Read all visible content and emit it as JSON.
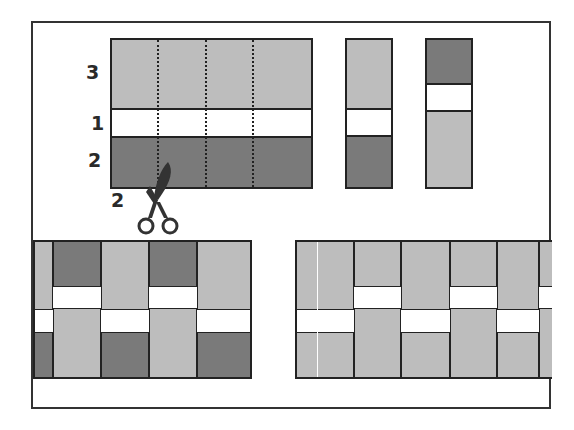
{
  "diagram": {
    "colors": {
      "light": "#bdbdbd",
      "dark": "#7a7a7a",
      "white": "#ffffff",
      "line": "#222222"
    },
    "top_block": {
      "bands": [
        {
          "label": "3",
          "tone": "light"
        },
        {
          "label": "1",
          "tone": "white"
        },
        {
          "label": "2",
          "tone": "dark"
        }
      ],
      "cut_lines": 3,
      "cut_label": "2",
      "tool": "scissors-icon"
    },
    "strips": [
      {
        "name": "strip-a",
        "bands": [
          "light",
          "white",
          "dark"
        ]
      },
      {
        "name": "strip-b",
        "bands": [
          "dark",
          "white",
          "light"
        ]
      }
    ],
    "bottom_panels": [
      {
        "name": "alternating-strips-panel",
        "pattern": "offset dark/light strips"
      },
      {
        "name": "light-strips-panel",
        "pattern": "offset light strips"
      }
    ]
  },
  "labels": {
    "band_top": "3",
    "band_mid": "1",
    "band_bottom": "2",
    "cut": "2"
  }
}
